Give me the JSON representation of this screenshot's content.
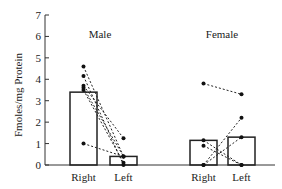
{
  "chart_data": {
    "type": "bar",
    "ylabel": "Fmoles/mg Protein",
    "ylim": [
      0,
      7
    ],
    "yticks": [
      0,
      1,
      2,
      3,
      4,
      5,
      6,
      7
    ],
    "grid": false,
    "legend": "none",
    "panels": [
      {
        "title": "Male",
        "categories": [
          "Right",
          "Left"
        ],
        "bar_values": [
          3.4,
          0.4
        ],
        "paired_points": [
          {
            "right": 4.6,
            "left": 0.4
          },
          {
            "right": 4.15,
            "left": 0.0
          },
          {
            "right": 3.7,
            "left": 1.25
          },
          {
            "right": 3.6,
            "left": 0.4
          },
          {
            "right": 3.5,
            "left": 0.1
          },
          {
            "right": 1.0,
            "left": 0.4
          }
        ]
      },
      {
        "title": "Female",
        "categories": [
          "Right",
          "Left"
        ],
        "bar_values": [
          1.15,
          1.3
        ],
        "paired_points": [
          {
            "right": 3.8,
            "left": 3.3
          },
          {
            "right": 0.0,
            "left": 2.2
          },
          {
            "right": 0.0,
            "left": 1.3
          },
          {
            "right": 1.15,
            "left": 0.0
          },
          {
            "right": 0.9,
            "left": 0.0
          }
        ]
      }
    ]
  }
}
